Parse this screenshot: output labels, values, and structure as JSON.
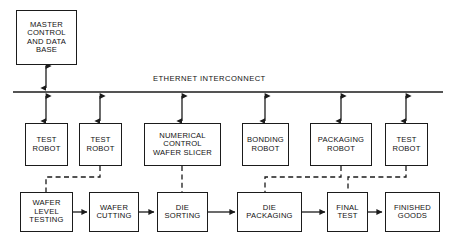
{
  "diagram": {
    "bus": {
      "label": "ETHERNET INTERCONNECT",
      "line_color": "#1b1b1b"
    },
    "colors": {
      "line": "#1b1b1b",
      "box_fill": "#ffffff",
      "text": "#111111",
      "background": "#ffffff"
    },
    "master": {
      "label": "MASTER\nCONTROL\nAND DATA\nBASE"
    },
    "equipment": [
      {
        "id": "test-robot-1",
        "label": "TEST\nROBOT"
      },
      {
        "id": "test-robot-2",
        "label": "TEST\nROBOT"
      },
      {
        "id": "numerical-control-wafer-slicer",
        "label": "NUMERICAL\nCONTROL\nWAFER SLICER"
      },
      {
        "id": "bonding-robot",
        "label": "BONDING\nROBOT"
      },
      {
        "id": "packaging-robot",
        "label": "PACKAGING\nROBOT"
      },
      {
        "id": "test-robot-3",
        "label": "TEST\nROBOT"
      }
    ],
    "process": [
      {
        "id": "wafer-level-testing",
        "label": "WAFER\nLEVEL\nTESTING"
      },
      {
        "id": "wafer-cutting",
        "label": "WAFER\nCUTTING"
      },
      {
        "id": "die-sorting",
        "label": "DIE\nSORTING"
      },
      {
        "id": "die-packaging",
        "label": "DIE\nPACKAGING"
      },
      {
        "id": "final-test",
        "label": "FINAL\nTEST"
      },
      {
        "id": "finished-goods",
        "label": "FINISHED\nGOODS"
      }
    ]
  }
}
